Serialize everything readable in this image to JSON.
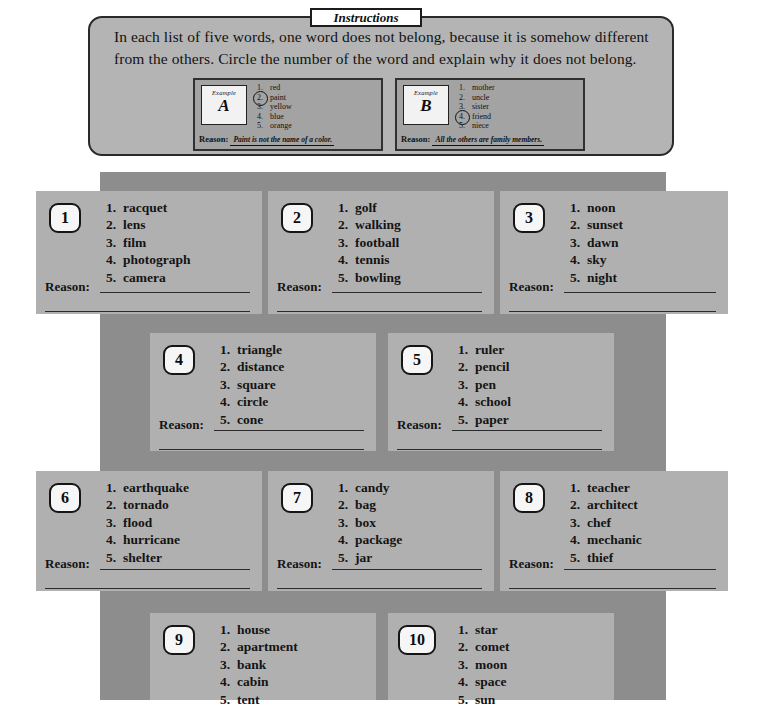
{
  "header": {
    "tab_label": "Instructions",
    "text": "In each list of five words, one word does not belong, because it is somehow different from the others. Circle the number of the word and explain why it does not belong."
  },
  "examples": [
    {
      "tag_word": "Example",
      "letter": "A",
      "words": [
        "red",
        "paint",
        "yellow",
        "blue",
        "orange"
      ],
      "circled": 2,
      "reason_label": "Reason:",
      "reason_text": "Paint is not the name of a color."
    },
    {
      "tag_word": "Example",
      "letter": "B",
      "words": [
        "mother",
        "uncle",
        "sister",
        "friend",
        "niece"
      ],
      "circled": 4,
      "reason_label": "Reason:",
      "reason_text": "All the others are family members."
    }
  ],
  "reason_label": "Reason:",
  "numbers": [
    "1",
    "2",
    "3",
    "4",
    "5",
    "6",
    "7",
    "8",
    "9",
    "10"
  ],
  "items": [
    {
      "number": "1",
      "words": [
        "racquet",
        "lens",
        "film",
        "photograph",
        "camera"
      ]
    },
    {
      "number": "2",
      "words": [
        "golf",
        "walking",
        "football",
        "tennis",
        "bowling"
      ]
    },
    {
      "number": "3",
      "words": [
        "noon",
        "sunset",
        "dawn",
        "sky",
        "night"
      ]
    },
    {
      "number": "4",
      "words": [
        "triangle",
        "distance",
        "square",
        "circle",
        "cone"
      ]
    },
    {
      "number": "5",
      "words": [
        "ruler",
        "pencil",
        "pen",
        "school",
        "paper"
      ]
    },
    {
      "number": "6",
      "words": [
        "earthquake",
        "tornado",
        "flood",
        "hurricane",
        "shelter"
      ]
    },
    {
      "number": "7",
      "words": [
        "candy",
        "bag",
        "box",
        "package",
        "jar"
      ]
    },
    {
      "number": "8",
      "words": [
        "teacher",
        "architect",
        "chef",
        "mechanic",
        "thief"
      ]
    },
    {
      "number": "9",
      "words": [
        "house",
        "apartment",
        "bank",
        "cabin",
        "tent"
      ]
    },
    {
      "number": "10",
      "words": [
        "star",
        "comet",
        "moon",
        "space",
        "sun"
      ]
    }
  ],
  "list_markers": [
    "1.",
    "2.",
    "3.",
    "4.",
    "5."
  ],
  "colors": {
    "page_background": "#ffffff",
    "band": "#8d8d8d",
    "card": "#b0b0b0",
    "instructions_panel": "#b4b4b4",
    "example_panel": "#a3a3a3",
    "ink": "#141414",
    "rule": "#2b2b2b"
  }
}
